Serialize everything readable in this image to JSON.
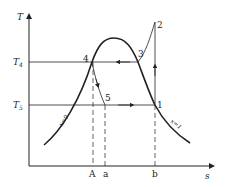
{
  "diagram": {
    "type": "T-s diagram (vapor compression cycle)",
    "axes": {
      "y_label": "T",
      "x_label": "s",
      "y_levels": [
        {
          "label": "T",
          "sub": "4"
        },
        {
          "label": "T",
          "sub": "5"
        }
      ],
      "x_marks": [
        "A",
        "a",
        "b"
      ]
    },
    "points": [
      "1",
      "2",
      "3",
      "4",
      "5"
    ],
    "curves": {
      "saturated_liquid": "x=0",
      "saturated_vapor": "x=1"
    },
    "colors": {
      "line": "#222222",
      "background": "#ffffff"
    }
  }
}
